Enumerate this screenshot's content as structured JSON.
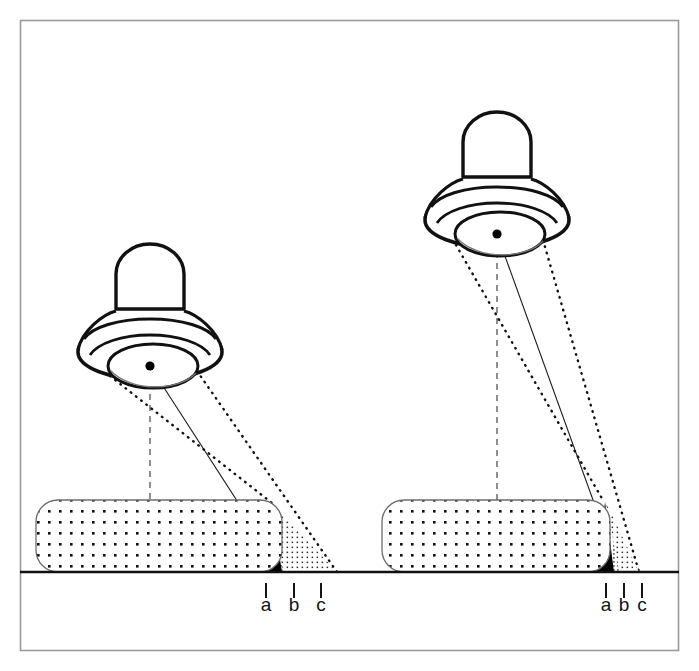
{
  "figure": {
    "border_color": "#9a9a9a",
    "ink_color": "#111111",
    "ground_color": "#111111",
    "umbra_color": "#000000",
    "penumbra_color": "#555555",
    "stipple_color": "#111111"
  },
  "scenes": [
    {
      "id": "left-scene",
      "name": "low-mounted-luminaire",
      "luminaire": {
        "name": "luminaire-left",
        "body_label": "lamp housing",
        "reflector_label": "reflector",
        "source_label": "light source point",
        "center_x": 150,
        "center_y": 366,
        "aperture_left_x": 110,
        "aperture_right_x": 197,
        "aperture_y": 374
      },
      "block": {
        "name": "object-block-left",
        "label": "obstructing block",
        "x": 36,
        "y": 500,
        "width": 246,
        "height": 72,
        "radius": 22
      },
      "shadow": {
        "umbra_label": "umbra",
        "penumbra_label": "penumbra",
        "apex_x": 272,
        "apex_y": 503,
        "umbra_end_x": 293,
        "penumbra_mid_x": 315,
        "penumbra_end_x": 337
      },
      "ticks": [
        {
          "label": "a",
          "x": 266
        },
        {
          "label": "b",
          "x": 294
        },
        {
          "label": "c",
          "x": 321
        }
      ]
    },
    {
      "id": "right-scene",
      "name": "high-mounted-luminaire",
      "luminaire": {
        "name": "luminaire-right",
        "body_label": "lamp housing",
        "reflector_label": "reflector",
        "source_label": "light source point",
        "center_x": 497,
        "center_y": 234,
        "aperture_left_x": 456,
        "aperture_right_x": 543,
        "aperture_y": 243
      },
      "block": {
        "name": "object-block-right",
        "label": "obstructing block",
        "x": 382,
        "y": 500,
        "width": 228,
        "height": 72,
        "radius": 22
      },
      "shadow": {
        "umbra_label": "umbra",
        "penumbra_label": "penumbra",
        "apex_x": 606,
        "apex_y": 502,
        "umbra_end_x": 615,
        "penumbra_mid_x": 625,
        "penumbra_end_x": 637
      },
      "ticks": [
        {
          "label": "a",
          "x": 606
        },
        {
          "label": "b",
          "x": 624
        },
        {
          "label": "c",
          "x": 642
        }
      ]
    }
  ],
  "ground": {
    "name": "ground-line",
    "y": 572,
    "x_start": 20,
    "x_end": 679
  },
  "tick_row": {
    "tick_top": 583,
    "tick_bottom": 598,
    "label_y": 611
  }
}
